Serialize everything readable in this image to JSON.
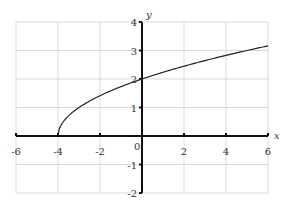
{
  "chart_data": {
    "type": "line",
    "title": "",
    "function": "y = sqrt(x + 4)",
    "xlabel": "x",
    "ylabel": "y",
    "xlim": [
      -6,
      6
    ],
    "ylim": [
      -2,
      4
    ],
    "grid": true,
    "x_ticks": [
      -6,
      -4,
      -2,
      0,
      2,
      4,
      6
    ],
    "y_ticks": [
      -2,
      -1,
      1,
      2,
      3,
      4
    ],
    "x_tick_labels": [
      "-6",
      "-4",
      "-2",
      "0",
      "2",
      "4",
      "6"
    ],
    "y_tick_labels": [
      "-2",
      "-1",
      "1",
      "2",
      "3",
      "4"
    ],
    "origin_label": "0",
    "series": [
      {
        "name": "sqrt(x+4)",
        "x": [
          -4,
          -3.75,
          -3.5,
          -3,
          -2,
          -1,
          0,
          1,
          2,
          3,
          4,
          5,
          6
        ],
        "y": [
          0,
          0.5,
          0.71,
          1,
          1.41,
          1.73,
          2,
          2.24,
          2.45,
          2.65,
          2.83,
          3,
          3.16
        ]
      }
    ]
  }
}
